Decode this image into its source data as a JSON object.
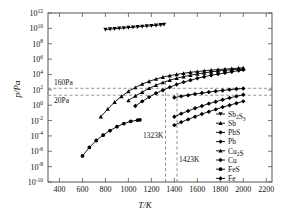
{
  "chart_data": {
    "type": "line",
    "title": "",
    "xlabel": "T/K",
    "ylabel": "p/Pa",
    "xlim": [
      300,
      2250
    ],
    "ylim": [
      -10,
      12
    ],
    "yscale": "log10",
    "grid": false,
    "legend_position": "bottom-right",
    "xticks": [
      400,
      600,
      800,
      1000,
      1200,
      1400,
      1600,
      1800,
      2000,
      2200
    ],
    "ytick_exponents": [
      12,
      10,
      8,
      6,
      4,
      2,
      0,
      -2,
      -4,
      -6,
      -8,
      -10
    ],
    "ytick_mantissa": "10",
    "annotations": [
      {
        "name": "160Pa-line",
        "text": "160Pa",
        "type": "hline",
        "value": 2.2
      },
      {
        "name": "20Pa-line",
        "text": "20Pa",
        "type": "hline",
        "value": 1.3
      },
      {
        "name": "1323K-line",
        "text": "1323K",
        "type": "vline",
        "value": 1323
      },
      {
        "name": "1423K-line",
        "text": "1423K",
        "type": "vline",
        "value": 1423
      }
    ],
    "series": [
      {
        "name": "Sb2S3",
        "label": "Sb₂S₃",
        "marker": "triangle-down",
        "x": [
          800,
          840,
          880,
          920,
          960,
          1000,
          1040,
          1080,
          1120,
          1160,
          1200,
          1240,
          1280,
          1310
        ],
        "y": [
          9.85,
          9.9,
          9.95,
          10.0,
          10.05,
          10.1,
          10.15,
          10.2,
          10.25,
          10.3,
          10.35,
          10.4,
          10.45,
          10.5
        ]
      },
      {
        "name": "Sb",
        "label": "Sb",
        "marker": "triangle-up",
        "x": [
          1000,
          1060,
          1120,
          1180,
          1240,
          1300,
          1360,
          1420,
          1480,
          1540,
          1600,
          1660,
          1720,
          1780,
          1840,
          1900,
          1960,
          2000
        ],
        "y": [
          0.6,
          1.2,
          1.7,
          2.2,
          2.6,
          2.95,
          3.25,
          3.5,
          3.72,
          3.9,
          4.06,
          4.2,
          4.33,
          4.44,
          4.54,
          4.62,
          4.7,
          4.75
        ]
      },
      {
        "name": "PbS",
        "label": "PbS",
        "marker": "diamond",
        "x": [
          1060,
          1120,
          1180,
          1240,
          1300,
          1360,
          1420,
          1480,
          1540,
          1600,
          1660,
          1720,
          1780,
          1840,
          1900,
          1960,
          2000
        ],
        "y": [
          -0.1,
          0.5,
          1.05,
          1.55,
          1.95,
          2.35,
          2.7,
          3.0,
          3.25,
          3.5,
          3.7,
          3.9,
          4.05,
          4.2,
          4.35,
          4.5,
          4.6
        ]
      },
      {
        "name": "Pb",
        "label": "Pb",
        "marker": "diamond",
        "x": [
          1400,
          1460,
          1520,
          1580,
          1640,
          1700,
          1760,
          1820,
          1880,
          1940,
          2000
        ],
        "y": [
          1.0,
          1.15,
          1.3,
          1.45,
          1.58,
          1.7,
          1.82,
          1.92,
          2.02,
          2.1,
          2.18
        ]
      },
      {
        "name": "Cu2S",
        "label": "Cu₂S",
        "marker": "triangle-up",
        "x": [
          760,
          820,
          880,
          940,
          1000,
          1060,
          1120,
          1180,
          1240,
          1300,
          1360,
          1420,
          1480,
          1540,
          1600,
          1660,
          1720,
          1780,
          1840,
          1900,
          1960,
          2000
        ],
        "y": [
          -1.5,
          -0.5,
          0.4,
          1.15,
          1.8,
          2.3,
          2.75,
          3.1,
          3.4,
          3.65,
          3.85,
          4.0,
          4.15,
          4.28,
          4.38,
          4.48,
          4.56,
          4.64,
          4.7,
          4.76,
          4.82,
          4.86
        ]
      },
      {
        "name": "Cu",
        "label": "Cu",
        "marker": "diamond",
        "x": [
          1400,
          1460,
          1520,
          1580,
          1640,
          1700,
          1760,
          1820,
          1880,
          1940,
          2000
        ],
        "y": [
          -1.5,
          -1.1,
          -0.75,
          -0.4,
          -0.1,
          0.2,
          0.45,
          0.7,
          0.95,
          1.15,
          1.35
        ]
      },
      {
        "name": "FeS",
        "label": "FeS",
        "marker": "circle",
        "x": [
          600,
          660,
          720,
          780,
          840,
          900,
          960,
          1020,
          1080,
          1100
        ],
        "y": [
          -6.6,
          -5.5,
          -4.6,
          -3.9,
          -3.3,
          -2.8,
          -2.4,
          -2.1,
          -1.95,
          -1.9
        ]
      },
      {
        "name": "Fe",
        "label": "Fe",
        "marker": "diamond",
        "x": [
          1400,
          1460,
          1520,
          1580,
          1640,
          1700,
          1760,
          1820,
          1880,
          1940,
          2000
        ],
        "y": [
          -2.6,
          -2.2,
          -1.85,
          -1.5,
          -1.15,
          -0.85,
          -0.55,
          -0.25,
          0.0,
          0.25,
          0.5
        ]
      }
    ]
  }
}
